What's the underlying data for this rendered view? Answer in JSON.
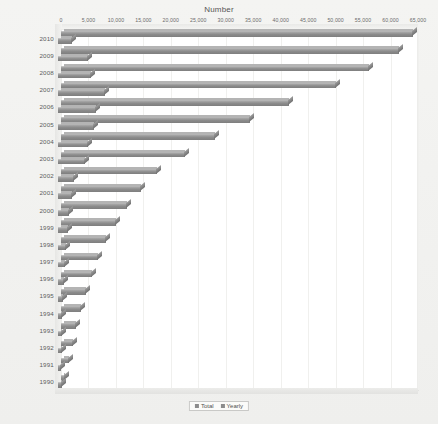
{
  "chart_data": {
    "type": "bar",
    "orientation": "horizontal",
    "title": "Number",
    "xlabel": "Number",
    "ylabel": "",
    "xlim": [
      0,
      65000
    ],
    "xticks": [
      0,
      5000,
      10000,
      15000,
      20000,
      25000,
      30000,
      35000,
      40000,
      45000,
      50000,
      55000,
      60000,
      65000
    ],
    "xtick_labels": [
      "0",
      "5,000",
      "10,000",
      "15,000",
      "20,000",
      "25,000",
      "30,000",
      "35,000",
      "40,000",
      "45,000",
      "50,000",
      "55,000",
      "60,000",
      "65,000"
    ],
    "grid": true,
    "legend_position": "bottom",
    "categories": [
      "2010",
      "2009",
      "2008",
      "2007",
      "2006",
      "2005",
      "2004",
      "2003",
      "2002",
      "2001",
      "2000",
      "1999",
      "1998",
      "1997",
      "1996",
      "1995",
      "1994",
      "1993",
      "1992",
      "1991",
      "1990"
    ],
    "series": [
      {
        "name": "Total",
        "color": "#8c8c8c",
        "values": [
          64000,
          61500,
          56000,
          50000,
          41500,
          34500,
          28000,
          22500,
          17500,
          14500,
          12000,
          10000,
          8200,
          6800,
          5600,
          4500,
          3600,
          2800,
          2100,
          1400,
          800
        ]
      },
      {
        "name": "Yearly",
        "color": "#8c8c8c",
        "values": [
          2500,
          5500,
          6000,
          8500,
          7000,
          6500,
          5500,
          5000,
          3000,
          2500,
          2000,
          1800,
          1400,
          1200,
          1100,
          900,
          800,
          700,
          700,
          600,
          800
        ]
      }
    ]
  },
  "legend": {
    "items": [
      {
        "label": "Total"
      },
      {
        "label": "Yearly"
      }
    ]
  }
}
